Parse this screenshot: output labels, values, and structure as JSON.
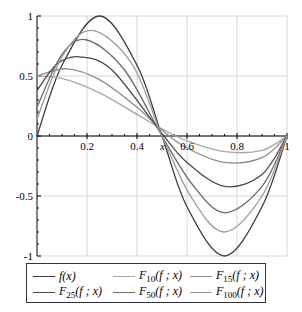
{
  "chart_data": {
    "type": "line",
    "title": "",
    "xlabel": "x",
    "ylabel": "",
    "xlim": [
      0,
      1
    ],
    "ylim": [
      -1,
      1
    ],
    "grid": true,
    "legend_position": "bottom",
    "x_ticks": [
      "0.2",
      "0.4",
      "0.6",
      "0.8",
      "1"
    ],
    "y_ticks": [
      "1",
      "0.5",
      "0",
      "-0.5",
      "-1"
    ],
    "series": [
      {
        "name": "f(x)",
        "legend_main": "f",
        "legend_sub": "",
        "legend_args": "(x)",
        "color": "#3a3a3a",
        "points": [
          [
            0,
            0
          ],
          [
            0.1,
            0.59
          ],
          [
            0.25,
            1.0
          ],
          [
            0.4,
            0.59
          ],
          [
            0.5,
            0
          ],
          [
            0.6,
            -0.59
          ],
          [
            0.75,
            -1.0
          ],
          [
            0.9,
            -0.59
          ],
          [
            1,
            0
          ]
        ]
      },
      {
        "name": "F10(f;x)",
        "legend_main": "F",
        "legend_sub": "10",
        "legend_args": "(f ; x)",
        "color": "#a8a8a8",
        "points": [
          [
            0,
            0.5
          ],
          [
            0.1,
            0.48
          ],
          [
            0.25,
            0.36
          ],
          [
            0.4,
            0.18
          ],
          [
            0.5,
            0.06
          ],
          [
            0.6,
            -0.04
          ],
          [
            0.75,
            -0.13
          ],
          [
            0.9,
            -0.12
          ],
          [
            1,
            0
          ]
        ]
      },
      {
        "name": "F15(f;x)",
        "legend_main": "F",
        "legend_sub": "15",
        "legend_args": "(f ; x)",
        "color": "#8e8e8e",
        "points": [
          [
            0,
            0.5
          ],
          [
            0.12,
            0.56
          ],
          [
            0.25,
            0.47
          ],
          [
            0.4,
            0.24
          ],
          [
            0.5,
            0.05
          ],
          [
            0.6,
            -0.1
          ],
          [
            0.75,
            -0.22
          ],
          [
            0.9,
            -0.18
          ],
          [
            1,
            0
          ]
        ]
      },
      {
        "name": "F25(f;x)",
        "legend_main": "F",
        "legend_sub": "25",
        "legend_args": "(f ; x)",
        "color": "#4a4a4a",
        "points": [
          [
            0,
            0.38
          ],
          [
            0.08,
            0.6
          ],
          [
            0.17,
            0.66
          ],
          [
            0.3,
            0.55
          ],
          [
            0.5,
            0.02
          ],
          [
            0.6,
            -0.22
          ],
          [
            0.75,
            -0.42
          ],
          [
            0.9,
            -0.32
          ],
          [
            1,
            0
          ]
        ]
      },
      {
        "name": "F50(f;x)",
        "legend_main": "F",
        "legend_sub": "50",
        "legend_args": "(f ; x)",
        "color": "#6a6a6a",
        "points": [
          [
            0,
            0.24
          ],
          [
            0.1,
            0.68
          ],
          [
            0.2,
            0.8
          ],
          [
            0.35,
            0.55
          ],
          [
            0.5,
            0
          ],
          [
            0.62,
            -0.4
          ],
          [
            0.75,
            -0.64
          ],
          [
            0.9,
            -0.42
          ],
          [
            1,
            0
          ]
        ]
      },
      {
        "name": "F100(f;x)",
        "legend_main": "F",
        "legend_sub": "100",
        "legend_args": "(f ; x)",
        "color": "#9a9a9a",
        "points": [
          [
            0,
            0.14
          ],
          [
            0.1,
            0.66
          ],
          [
            0.22,
            0.88
          ],
          [
            0.38,
            0.6
          ],
          [
            0.5,
            0
          ],
          [
            0.62,
            -0.52
          ],
          [
            0.75,
            -0.8
          ],
          [
            0.9,
            -0.5
          ],
          [
            1,
            0
          ]
        ]
      }
    ]
  },
  "legend": {
    "rows": [
      [
        0,
        1,
        2
      ],
      [
        3,
        4,
        5
      ]
    ]
  }
}
